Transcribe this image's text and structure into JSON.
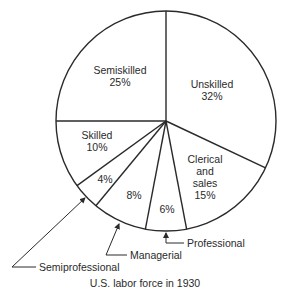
{
  "chart_data": {
    "type": "pie",
    "title": "U.S. labor force in 1930",
    "start_angle": "12 o'clock, clockwise",
    "categories": [
      "Unskilled",
      "Clerical and sales",
      "Professional",
      "Managerial",
      "Semiprofessional",
      "Skilled",
      "Semiskilled"
    ],
    "values": [
      32,
      15,
      6,
      8,
      4,
      10,
      25
    ],
    "unit": "%",
    "slice_labels": {
      "unskilled": {
        "name": "Unskilled",
        "pct": "32%"
      },
      "clerical": {
        "line1": "Clerical",
        "line2": "and",
        "line3": "sales",
        "pct": "15%"
      },
      "professional": {
        "name": "Professional",
        "pct": "6%"
      },
      "managerial": {
        "name": "Managerial",
        "pct": "8%"
      },
      "semiprofessional": {
        "name": "Semiprofessional",
        "pct": "4%"
      },
      "skilled": {
        "name": "Skilled",
        "pct": "10%"
      },
      "semiskilled": {
        "name": "Semiskilled",
        "pct": "25%"
      }
    },
    "colors": {
      "stroke": "#2a2a2a",
      "fill": "#ffffff",
      "text": "#2a2a2a"
    }
  },
  "caption": "U.S. labor force in 1930"
}
